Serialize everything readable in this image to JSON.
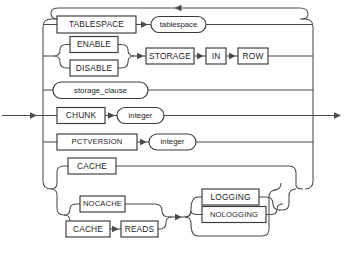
{
  "diagram": {
    "kind": "railroad-syntax-diagram",
    "name": "LOB_storage_parameters",
    "canvas": {
      "width": 345,
      "height": 262,
      "background": "#ffffff"
    },
    "colors": {
      "line": "#4a4a4a",
      "box_stroke": "#3a3a3a",
      "text": "#1d1d1d",
      "fill": "#ffffff"
    },
    "entry_label": "",
    "exit_label": "",
    "alternatives": [
      {
        "id": "tablespace",
        "terminals": [
          "TABLESPACE"
        ],
        "nonterminals": [
          "tablespace"
        ]
      },
      {
        "id": "storage-in-row",
        "choice": [
          "ENABLE",
          "DISABLE"
        ],
        "terminals": [
          "STORAGE",
          "IN",
          "ROW"
        ]
      },
      {
        "id": "storage-clause",
        "nonterminals": [
          "storage_clause"
        ]
      },
      {
        "id": "chunk",
        "terminals": [
          "CHUNK"
        ],
        "nonterminals": [
          "integer"
        ]
      },
      {
        "id": "pctversion",
        "terminals": [
          "PCTVERSION"
        ],
        "nonterminals": [
          "integer"
        ]
      },
      {
        "id": "cache",
        "terminals": [
          "CACHE"
        ]
      },
      {
        "id": "nocache-logging",
        "choice": [
          "NOCACHE",
          "CACHE READS"
        ],
        "optional_choice": [
          "LOGGING",
          "NOLOGGING"
        ]
      }
    ]
  },
  "nodes": {
    "tablespace_kw": "TABLESPACE",
    "tablespace_nt": "tablespace",
    "enable": "ENABLE",
    "disable": "DISABLE",
    "storage": "STORAGE",
    "in": "IN",
    "row": "ROW",
    "storage_clause": "storage_clause",
    "chunk": "CHUNK",
    "chunk_int": "integer",
    "pctversion": "PCTVERSION",
    "pctversion_int": "integer",
    "cache": "CACHE",
    "nocache": "NOCACHE",
    "cache2": "CACHE",
    "reads": "READS",
    "logging": "LOGGING",
    "nologging": "NOLOGGING"
  }
}
